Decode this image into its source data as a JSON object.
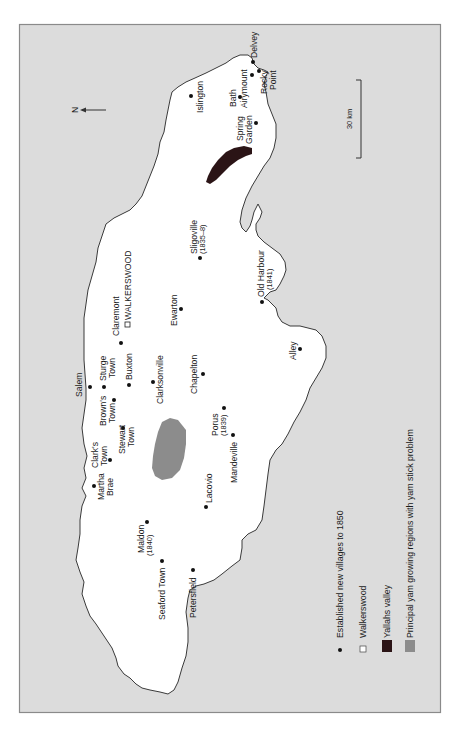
{
  "map": {
    "title": "",
    "orientation": "rotated 90deg clockwise (north points left)",
    "north_label": "N",
    "scale_label": "30 km",
    "colors": {
      "sea": "#dcdcdc",
      "land": "#ffffff",
      "yallahs_valley": "#2b1416",
      "yam_regions": "#8c8c8c",
      "village_dot": "#111111"
    },
    "places": [
      {
        "name": "Delvey",
        "x": 253,
        "y": 62
      },
      {
        "name": "Rocky Point",
        "line1": "Rocky",
        "line2": "Point",
        "x": 259,
        "y": 71
      },
      {
        "name": "Airymount",
        "x": 252,
        "y": 75
      },
      {
        "name": "Islington",
        "x": 191,
        "y": 96
      },
      {
        "name": "Bath",
        "x": 240,
        "y": 97
      },
      {
        "name": "Spring Garden",
        "line1": "Spring",
        "line2": "Garden",
        "x": 256,
        "y": 123
      },
      {
        "name": "Sligoville",
        "sub": "(1835–8)",
        "x": 200,
        "y": 258
      },
      {
        "name": "Old Harbour",
        "sub": "(1841)",
        "x": 262,
        "y": 302
      },
      {
        "name": "WALKERSWOOD",
        "x": 127,
        "y": 326,
        "square": true
      },
      {
        "name": "Ewarton",
        "x": 181,
        "y": 309
      },
      {
        "name": "Claremont",
        "x": 121,
        "y": 343
      },
      {
        "name": "Alley",
        "x": 300,
        "y": 349
      },
      {
        "name": "Buxton",
        "x": 129,
        "y": 385
      },
      {
        "name": "Sturge Town",
        "line1": "Sturge",
        "line2": "Town",
        "x": 104,
        "y": 387
      },
      {
        "name": "Salem",
        "x": 90,
        "y": 387
      },
      {
        "name": "Chapelton",
        "x": 203,
        "y": 374
      },
      {
        "name": "Clarksonville",
        "x": 153,
        "y": 382
      },
      {
        "name": "Brown's Town",
        "line1": "Brown's",
        "line2": "Town",
        "x": 114,
        "y": 400
      },
      {
        "name": "Porus",
        "sub": "(1839)",
        "x": 224,
        "y": 408
      },
      {
        "name": "Stewart Town",
        "line1": "Stewart",
        "line2": "Town",
        "x": 123,
        "y": 428
      },
      {
        "name": "Mandeville",
        "x": 233,
        "y": 435
      },
      {
        "name": "Clark's Town",
        "line1": "Clark's",
        "line2": "Town",
        "x": 110,
        "y": 460
      },
      {
        "name": "Martha Brae",
        "line1": "Martha",
        "line2": "Brae",
        "x": 94,
        "y": 486
      },
      {
        "name": "Lacovio",
        "x": 206,
        "y": 507
      },
      {
        "name": "Maldon",
        "sub": "(1840)",
        "x": 147,
        "y": 522
      },
      {
        "name": "Seaford Town",
        "x": 162,
        "y": 561
      },
      {
        "name": "Petersfield",
        "x": 193,
        "y": 570
      }
    ]
  },
  "legend": {
    "items": [
      {
        "symbol": "dot",
        "label": "Established new villages to 1850"
      },
      {
        "symbol": "white-square",
        "label": "Walkerswood"
      },
      {
        "symbol": "dark-square",
        "label": "Yallahs valley"
      },
      {
        "symbol": "grey-square",
        "label": "Principal yam growing regions with yam stick problem"
      }
    ]
  }
}
